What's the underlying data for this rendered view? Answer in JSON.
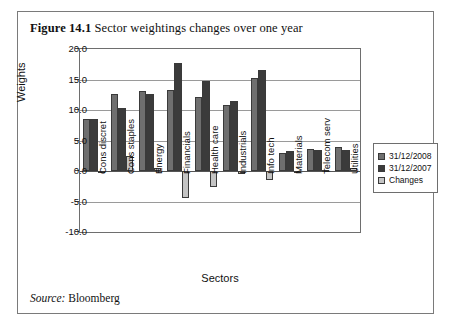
{
  "figure": {
    "number": "Figure 14.1",
    "caption": "Sector weightings changes over one year",
    "source_label": "Source:",
    "source_value": "Bloomberg"
  },
  "legend": {
    "position": "right",
    "items": [
      {
        "label": "31/12/2008",
        "color": "#6f6f6f"
      },
      {
        "label": "31/12/2007",
        "color": "#3b3b3b"
      },
      {
        "label": "Changes",
        "color": "#c4c4c4"
      }
    ]
  },
  "chart_data": {
    "type": "bar",
    "title": "Sector weightings changes over one year",
    "xlabel": "Sectors",
    "ylabel": "Weights",
    "ylim": [
      -10.0,
      20.0
    ],
    "ytick_step": 5.0,
    "yticks": [
      "20.0",
      "15.0",
      "10.0",
      "5.0",
      "0.0",
      "-5.0",
      "-10.0"
    ],
    "ytick_values": [
      20.0,
      15.0,
      10.0,
      5.0,
      0.0,
      -5.0,
      -10.0
    ],
    "grid": true,
    "categories": [
      "Cons discret",
      "Cons staples",
      "Energy",
      "Financials",
      "Health care",
      "Industrials",
      "Info tech",
      "Materials",
      "Telecom serv",
      "Utilities"
    ],
    "series": [
      {
        "name": "31/12/2008",
        "color": "#6f6f6f",
        "values": [
          8.5,
          12.7,
          13.1,
          13.2,
          12.1,
          10.9,
          15.2,
          3.0,
          3.6,
          3.9
        ]
      },
      {
        "name": "31/12/2007",
        "color": "#3b3b3b",
        "values": [
          8.6,
          10.3,
          12.6,
          17.7,
          14.7,
          11.4,
          16.6,
          3.2,
          3.5,
          3.4
        ]
      },
      {
        "name": "Changes",
        "color": "#c4c4c4",
        "values": [
          -0.1,
          2.4,
          0.5,
          -4.5,
          -2.6,
          -0.5,
          -1.4,
          -0.2,
          0.1,
          0.5
        ]
      }
    ]
  }
}
